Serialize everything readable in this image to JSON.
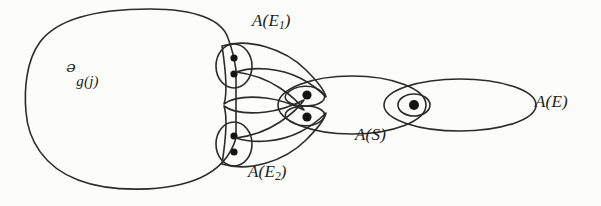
{
  "figure": {
    "background_color": "#fcfcfa",
    "ink_color": "#2b2b2b",
    "labels": {
      "universe_base": "ᵊ",
      "universe_sub": "g(j)",
      "universe_full": "U_g(j)",
      "a_e1_base": "A(E",
      "a_e1_sub": "1",
      "a_e1_close": ")",
      "a_e2_base": "A(E",
      "a_e2_sub": "2",
      "a_e2_close": ")",
      "a_s": "A(S)",
      "a_e": "A(E)"
    },
    "regions": [
      {
        "name": "universe-blob",
        "label": "U_g(j)",
        "shape": "rounded-blob",
        "dots": 0
      },
      {
        "name": "upper-two-dot-oval",
        "label": "",
        "shape": "small-oval",
        "dots": 2
      },
      {
        "name": "lower-two-dot-oval",
        "label": "",
        "shape": "small-oval",
        "dots": 2
      },
      {
        "name": "a-e1-crescent",
        "label": "A(E1)",
        "shape": "crescent",
        "dots": 0
      },
      {
        "name": "a-e2-crescent",
        "label": "A(E2)",
        "shape": "crescent",
        "dots": 0
      },
      {
        "name": "upper-one-dot-lens",
        "label": "",
        "shape": "lens",
        "dots": 1
      },
      {
        "name": "lower-one-dot-lens",
        "label": "",
        "shape": "lens",
        "dots": 1
      },
      {
        "name": "a-s-ellipse",
        "label": "A(S)",
        "shape": "ellipse",
        "dots": 0
      },
      {
        "name": "middle-one-dot-lens",
        "label": "",
        "shape": "lens",
        "dots": 1
      },
      {
        "name": "a-e-ellipse",
        "label": "A(E)",
        "shape": "ellipse",
        "dots": 0
      }
    ],
    "dot_count_total": 7
  }
}
